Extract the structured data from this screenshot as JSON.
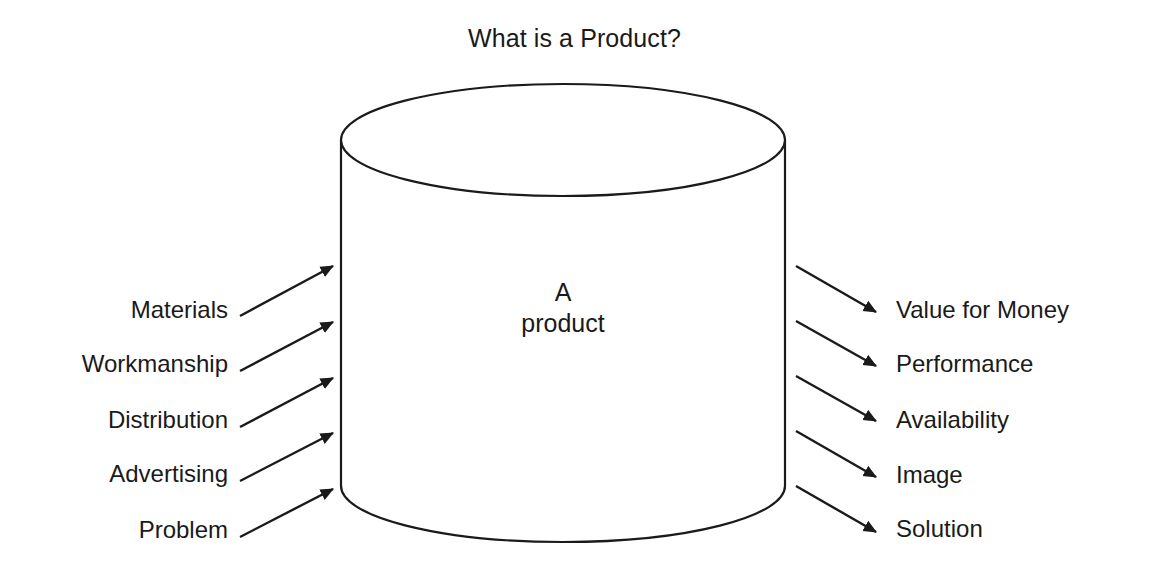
{
  "diagram": {
    "title": "What is a Product?",
    "center_label": "A\nproduct",
    "shape": "cylinder",
    "colors": {
      "background": "#ffffff",
      "stroke": "#1a1a1a",
      "text": "#1a1a1a"
    },
    "inputs": [
      {
        "label": "Materials",
        "label_x": 228,
        "label_y": 310,
        "line_x1": 240,
        "line_y1": 316,
        "line_x2": 333,
        "line_y2": 266
      },
      {
        "label": "Workmanship",
        "label_x": 228,
        "label_y": 364,
        "line_x1": 240,
        "line_y1": 371,
        "line_x2": 333,
        "line_y2": 322
      },
      {
        "label": "Distribution",
        "label_x": 228,
        "label_y": 420,
        "line_x1": 240,
        "line_y1": 427,
        "line_x2": 333,
        "line_y2": 378
      },
      {
        "label": "Advertising",
        "label_x": 228,
        "label_y": 474,
        "line_x1": 240,
        "line_y1": 481,
        "line_x2": 333,
        "line_y2": 433
      },
      {
        "label": "Problem",
        "label_x": 228,
        "label_y": 530,
        "line_x1": 240,
        "line_y1": 537,
        "line_x2": 333,
        "line_y2": 489
      }
    ],
    "outputs": [
      {
        "label": "Value for Money",
        "label_x": 896,
        "label_y": 310,
        "line_x1": 796,
        "line_y1": 266,
        "line_x2": 876,
        "line_y2": 312
      },
      {
        "label": "Performance",
        "label_x": 896,
        "label_y": 364,
        "line_x1": 796,
        "line_y1": 321,
        "line_x2": 876,
        "line_y2": 366
      },
      {
        "label": "Availability",
        "label_x": 896,
        "label_y": 420,
        "line_x1": 796,
        "line_y1": 376,
        "line_x2": 876,
        "line_y2": 421
      },
      {
        "label": "Image",
        "label_x": 896,
        "label_y": 475,
        "line_x1": 796,
        "line_y1": 431,
        "line_x2": 876,
        "line_y2": 477
      },
      {
        "label": "Solution",
        "label_x": 896,
        "label_y": 529,
        "line_x1": 796,
        "line_y1": 486,
        "line_x2": 876,
        "line_y2": 532
      }
    ],
    "cylinder": {
      "left": 341,
      "right": 785,
      "top": 84,
      "bottom": 542,
      "ellipse_ry": 56,
      "center_x": 563,
      "center_y": 308
    }
  }
}
